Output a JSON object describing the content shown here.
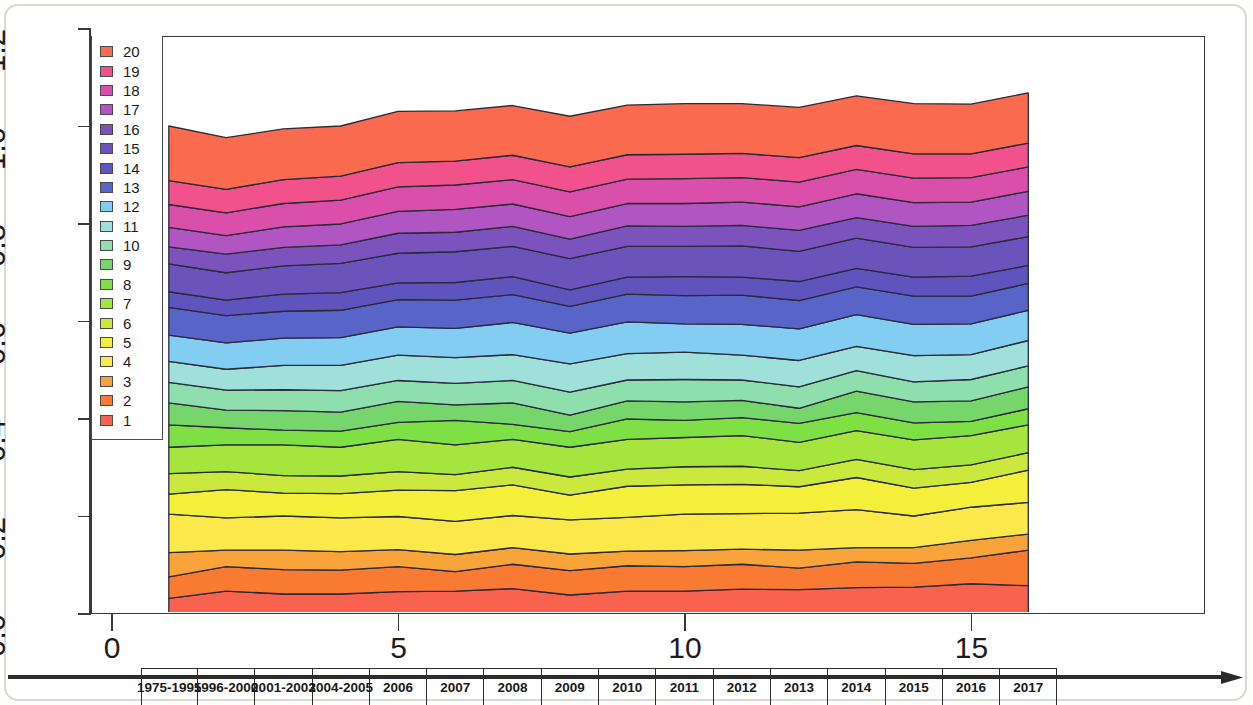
{
  "chart_data": {
    "type": "area",
    "title": "",
    "subtitle": "",
    "xlabel": "",
    "ylabel": "",
    "stacked": true,
    "grid": false,
    "legend_position": "top-left",
    "xlim": [
      0,
      16.8
    ],
    "ylim": [
      0.0,
      1.2
    ],
    "y_ticks": [
      "1.2",
      "1.0",
      "0.8",
      "0.6",
      "0.4",
      "0.2",
      "0.0"
    ],
    "y_tick_values": [
      1.2,
      1.0,
      0.8,
      0.6,
      0.4,
      0.2,
      0.0
    ],
    "x_ticks": [
      "0",
      "5",
      "10",
      "15"
    ],
    "x_tick_values": [
      0,
      5,
      10,
      15
    ],
    "x_index": [
      1,
      2,
      3,
      4,
      5,
      6,
      7,
      8,
      9,
      10,
      11,
      12,
      13,
      14,
      15,
      16
    ],
    "categories": [
      "1975-1995",
      "1996-2000",
      "2001-2003",
      "2004-2005",
      "2006",
      "2007",
      "2008",
      "2009",
      "2010",
      "2011",
      "2012",
      "2013",
      "2014",
      "2015",
      "2016",
      "2017"
    ],
    "series": [
      {
        "name": "1",
        "color": "#f9624e",
        "values": [
          0.031,
          0.046,
          0.04,
          0.04,
          0.045,
          0.046,
          0.051,
          0.038,
          0.046,
          0.046,
          0.05,
          0.049,
          0.053,
          0.054,
          0.061,
          0.057
        ]
      },
      {
        "name": "2",
        "color": "#f97a33",
        "values": [
          0.044,
          0.05,
          0.05,
          0.049,
          0.051,
          0.04,
          0.05,
          0.05,
          0.052,
          0.05,
          0.051,
          0.044,
          0.053,
          0.049,
          0.053,
          0.073
        ]
      },
      {
        "name": "3",
        "color": "#f9a33b",
        "values": [
          0.05,
          0.034,
          0.04,
          0.038,
          0.035,
          0.035,
          0.034,
          0.034,
          0.03,
          0.033,
          0.031,
          0.037,
          0.029,
          0.032,
          0.036,
          0.033
        ]
      },
      {
        "name": "4",
        "color": "#fbe84a",
        "values": [
          0.079,
          0.066,
          0.07,
          0.069,
          0.068,
          0.068,
          0.066,
          0.07,
          0.069,
          0.075,
          0.073,
          0.076,
          0.078,
          0.065,
          0.068,
          0.065
        ]
      },
      {
        "name": "5",
        "color": "#f4ef3a",
        "values": [
          0.041,
          0.058,
          0.047,
          0.05,
          0.054,
          0.063,
          0.063,
          0.051,
          0.064,
          0.06,
          0.06,
          0.054,
          0.066,
          0.057,
          0.051,
          0.066
        ]
      },
      {
        "name": "6",
        "color": "#cbe83e",
        "values": [
          0.042,
          0.037,
          0.036,
          0.036,
          0.038,
          0.033,
          0.036,
          0.037,
          0.035,
          0.037,
          0.037,
          0.033,
          0.037,
          0.038,
          0.036,
          0.036
        ]
      },
      {
        "name": "7",
        "color": "#a5e53d",
        "values": [
          0.054,
          0.055,
          0.063,
          0.059,
          0.066,
          0.061,
          0.057,
          0.061,
          0.061,
          0.06,
          0.063,
          0.058,
          0.059,
          0.061,
          0.06,
          0.057
        ]
      },
      {
        "name": "8",
        "color": "#7ee045",
        "values": [
          0.046,
          0.035,
          0.03,
          0.033,
          0.035,
          0.05,
          0.031,
          0.032,
          0.042,
          0.035,
          0.037,
          0.039,
          0.037,
          0.035,
          0.029,
          0.033
        ]
      },
      {
        "name": "9",
        "color": "#76d56b",
        "values": [
          0.045,
          0.036,
          0.04,
          0.039,
          0.043,
          0.032,
          0.044,
          0.034,
          0.037,
          0.038,
          0.035,
          0.031,
          0.044,
          0.043,
          0.042,
          0.045
        ]
      },
      {
        "name": "10",
        "color": "#8fdfae",
        "values": [
          0.042,
          0.041,
          0.043,
          0.044,
          0.043,
          0.044,
          0.046,
          0.047,
          0.043,
          0.046,
          0.042,
          0.044,
          0.042,
          0.041,
          0.044,
          0.043
        ]
      },
      {
        "name": "11",
        "color": "#9fe0da",
        "values": [
          0.043,
          0.043,
          0.05,
          0.052,
          0.052,
          0.053,
          0.053,
          0.058,
          0.054,
          0.056,
          0.051,
          0.054,
          0.05,
          0.054,
          0.051,
          0.052
        ]
      },
      {
        "name": "12",
        "color": "#84cdf2",
        "values": [
          0.054,
          0.054,
          0.056,
          0.057,
          0.058,
          0.06,
          0.066,
          0.063,
          0.065,
          0.058,
          0.063,
          0.065,
          0.065,
          0.064,
          0.063,
          0.062
        ]
      },
      {
        "name": "13",
        "color": "#5964c8",
        "values": [
          0.057,
          0.056,
          0.055,
          0.056,
          0.056,
          0.058,
          0.057,
          0.055,
          0.057,
          0.058,
          0.06,
          0.058,
          0.057,
          0.058,
          0.057,
          0.055
        ]
      },
      {
        "name": "14",
        "color": "#5f53bd",
        "values": [
          0.032,
          0.032,
          0.035,
          0.036,
          0.034,
          0.036,
          0.037,
          0.034,
          0.035,
          0.039,
          0.037,
          0.039,
          0.038,
          0.039,
          0.041,
          0.037
        ]
      },
      {
        "name": "15",
        "color": "#6a53bb",
        "values": [
          0.057,
          0.056,
          0.058,
          0.06,
          0.061,
          0.063,
          0.062,
          0.064,
          0.063,
          0.062,
          0.064,
          0.062,
          0.062,
          0.061,
          0.06,
          0.059
        ]
      },
      {
        "name": "16",
        "color": "#7c52bc",
        "values": [
          0.035,
          0.038,
          0.038,
          0.038,
          0.041,
          0.04,
          0.041,
          0.04,
          0.042,
          0.041,
          0.042,
          0.043,
          0.042,
          0.043,
          0.044,
          0.044
        ]
      },
      {
        "name": "17",
        "color": "#b155c2",
        "values": [
          0.04,
          0.038,
          0.042,
          0.043,
          0.045,
          0.047,
          0.046,
          0.046,
          0.046,
          0.047,
          0.048,
          0.048,
          0.049,
          0.049,
          0.048,
          0.049
        ]
      },
      {
        "name": "18",
        "color": "#d94fa9",
        "values": [
          0.047,
          0.047,
          0.048,
          0.049,
          0.05,
          0.05,
          0.05,
          0.051,
          0.05,
          0.051,
          0.05,
          0.051,
          0.05,
          0.05,
          0.05,
          0.05
        ]
      },
      {
        "name": "19",
        "color": "#f2528c",
        "values": [
          0.049,
          0.048,
          0.049,
          0.049,
          0.05,
          0.049,
          0.05,
          0.051,
          0.05,
          0.05,
          0.05,
          0.05,
          0.049,
          0.05,
          0.049,
          0.049
        ]
      },
      {
        "name": "20",
        "color": "#fa6a4e",
        "values": [
          0.112,
          0.106,
          0.104,
          0.103,
          0.105,
          0.103,
          0.102,
          0.104,
          0.102,
          0.104,
          0.102,
          0.103,
          0.102,
          0.103,
          0.102,
          0.103
        ]
      }
    ],
    "totals": [
      1.0,
      0.976,
      0.994,
      1.0,
      1.03,
      1.031,
      1.042,
      1.02,
      1.043,
      1.046,
      1.046,
      1.038,
      1.062,
      1.046,
      1.045,
      1.068
    ]
  },
  "legend": {
    "entries": [
      {
        "label": "20",
        "color": "#fa6a4e"
      },
      {
        "label": "19",
        "color": "#f2528c"
      },
      {
        "label": "18",
        "color": "#d94fa9"
      },
      {
        "label": "17",
        "color": "#b155c2"
      },
      {
        "label": "16",
        "color": "#7c52bc"
      },
      {
        "label": "15",
        "color": "#6a53bb"
      },
      {
        "label": "14",
        "color": "#5f53bd"
      },
      {
        "label": "13",
        "color": "#5964c8"
      },
      {
        "label": "12",
        "color": "#84cdf2"
      },
      {
        "label": "11",
        "color": "#9fe0da"
      },
      {
        "label": "10",
        "color": "#8fdfae"
      },
      {
        "label": "9",
        "color": "#76d56b"
      },
      {
        "label": "8",
        "color": "#7ee045"
      },
      {
        "label": "7",
        "color": "#a5e53d"
      },
      {
        "label": "6",
        "color": "#cbe83e"
      },
      {
        "label": "5",
        "color": "#f4ef3a"
      },
      {
        "label": "4",
        "color": "#fbe84a"
      },
      {
        "label": "3",
        "color": "#f9a33b"
      },
      {
        "label": "2",
        "color": "#f97a33"
      },
      {
        "label": "1",
        "color": "#f9624e"
      }
    ]
  },
  "axis_colors": {
    "axis_line": "#3a3a3a",
    "band_border": "#2b2b2b",
    "text": "#1d1d1d"
  }
}
